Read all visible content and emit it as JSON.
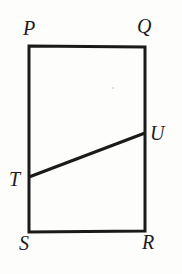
{
  "figure": {
    "background_color": "#fdfdfc",
    "stroke_color": "#1a1a1a",
    "label_color": "#1c1c1c",
    "canvas": {
      "width": 182,
      "height": 274
    },
    "rectangle": {
      "name": "PQRS",
      "stroke_width": 3,
      "corners": {
        "top_left": {
          "label": "P",
          "x": 29,
          "y": 46
        },
        "top_right": {
          "label": "Q",
          "x": 145,
          "y": 47
        },
        "bottom_right": {
          "label": "R",
          "x": 145,
          "y": 231
        },
        "bottom_left": {
          "label": "S",
          "x": 29,
          "y": 232
        }
      }
    },
    "segment": {
      "name": "TU",
      "stroke_width": 3,
      "start": {
        "label": "T",
        "x": 29,
        "y": 177,
        "on_edge": "PS"
      },
      "end": {
        "label": "U",
        "x": 145,
        "y": 133,
        "on_edge": "QR"
      }
    },
    "labels": {
      "p": "P",
      "q": "Q",
      "r": "R",
      "s": "S",
      "t": "T",
      "u": "U"
    },
    "artifacts": {
      "speck": {
        "x": 112,
        "y": 87
      }
    }
  }
}
